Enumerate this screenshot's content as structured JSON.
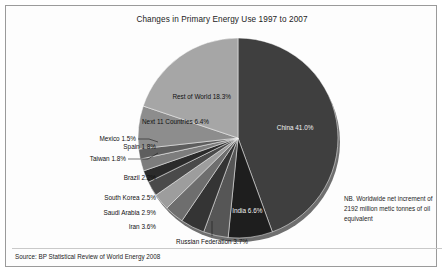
{
  "chart_data": {
    "type": "pie",
    "title": "Changes in Primary Energy Use 1997 to 2007",
    "xlabel": "",
    "ylabel": "",
    "legend_position": "none",
    "grid": false,
    "start_angle_deg": 0,
    "direction": "clockwise",
    "categories": [
      "China",
      "India",
      "Russian Federation",
      "Iran",
      "Saudi Arabia",
      "South Korea",
      "Brazil",
      "Taiwan",
      "Spain",
      "Mexico",
      "Next 11 Countries",
      "Rest of World"
    ],
    "values": [
      41.0,
      6.6,
      3.7,
      3.6,
      2.9,
      2.5,
      2.2,
      1.8,
      1.8,
      1.5,
      6.4,
      18.3
    ],
    "labels": [
      "China 41.0%",
      "India 6.6%",
      "Russian Federation 3.7%",
      "Iran 3.6%",
      "Saudi Arabia 2.9%",
      "South Korea 2.5%",
      "Brazil 2.2%",
      "Taiwan 1.8%",
      "Spain 1.8%",
      "Mexico 1.5%",
      "Next 11 Countries 6.4%",
      "Rest of World 18.3%"
    ],
    "colors": [
      "#3f3f3f",
      "#1e1e1e",
      "#565656",
      "#343434",
      "#6e6e6e",
      "#9d9d9d",
      "#4a4a4a",
      "#2b2b2b",
      "#7d7d7d",
      "#5e5e5e",
      "#8d8d8d",
      "#a6a6a6"
    ],
    "annotations": [
      "NB. Worldwide net increment of 2192 million metic tonnes of oil equivalent"
    ]
  },
  "labels": {
    "china": "China 41.0%",
    "india": "India 6.6%",
    "russian_federation": "Russian Federation 3.7%",
    "iran": "Iran 3.6%",
    "saudi_arabia": "Saudi Arabia 2.9%",
    "south_korea": "South Korea 2.5%",
    "brazil": "Brazil 2.2%",
    "taiwan": "Taiwan 1.8%",
    "spain": "Spain 1.8%",
    "mexico": "Mexico 1.5%",
    "next_11": "Next 11 Countries 6.4%",
    "rest_of_world": "Rest of World 18.3%"
  },
  "note": {
    "text": "NB. Worldwide net increment of 2192 million metic tonnes of oil equivalent"
  },
  "source": {
    "text": "Source: BP Statistical Review of World Energy 2008"
  }
}
